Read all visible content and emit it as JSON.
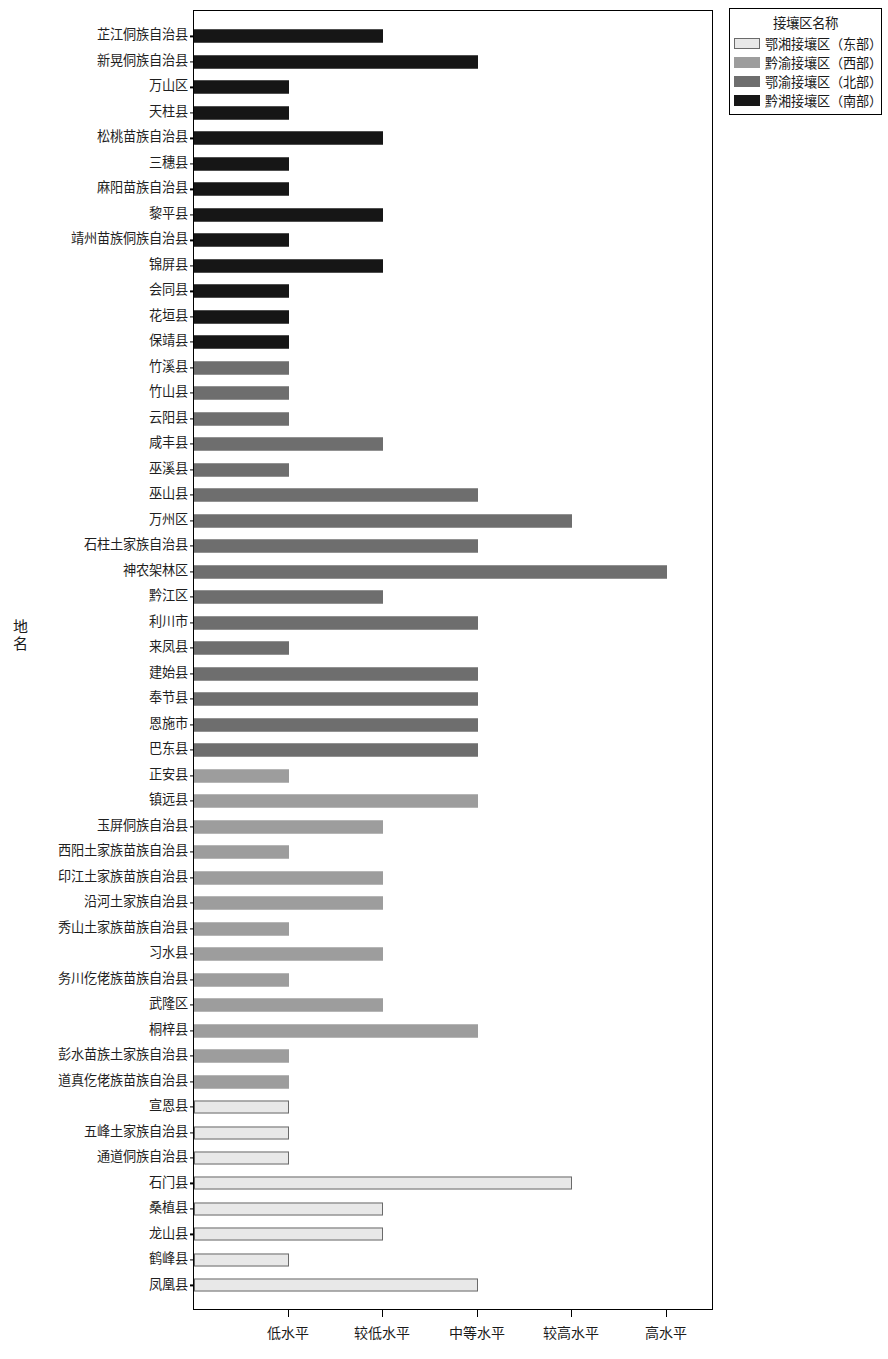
{
  "chart_data": {
    "type": "bar",
    "orientation": "horizontal",
    "title": "",
    "xlabel": "",
    "ylabel": "地名",
    "x_tick_labels": [
      "低水平",
      "较低水平",
      "中等水平",
      "较高水平",
      "高水平"
    ],
    "x_tick_values": [
      1,
      2,
      3,
      4,
      5
    ],
    "xlim": [
      0,
      5.5
    ],
    "grid": false,
    "legend": {
      "title": "接壤区名称",
      "position": "top-right",
      "entries": [
        {
          "label": "鄂湘接壤区（东部）",
          "color": "#e8e8e8"
        },
        {
          "label": "黔渝接壤区（西部）",
          "color": "#9d9d9d"
        },
        {
          "label": "鄂渝接壤区（北部）",
          "color": "#6e6e6e"
        },
        {
          "label": "黔湘接壤区（南部）",
          "color": "#161616"
        }
      ]
    },
    "categories": [
      "芷江侗族自治县",
      "新晃侗族自治县",
      "万山区",
      "天柱县",
      "松桃苗族自治县",
      "三穗县",
      "麻阳苗族自治县",
      "黎平县",
      "靖州苗族侗族自治县",
      "锦屏县",
      "会同县",
      "花垣县",
      "保靖县",
      "竹溪县",
      "竹山县",
      "云阳县",
      "咸丰县",
      "巫溪县",
      "巫山县",
      "万州区",
      "石柱土家族自治县",
      "神农架林区",
      "黔江区",
      "利川市",
      "来凤县",
      "建始县",
      "奉节县",
      "恩施市",
      "巴东县",
      "正安县",
      "镇远县",
      "玉屏侗族自治县",
      "西阳土家族苗族自治县",
      "印江土家族苗族自治县",
      "沿河土家族自治县",
      "秀山土家族苗族自治县",
      "习水县",
      "务川仡佬族苗族自治县",
      "武隆区",
      "桐梓县",
      "彭水苗族土家族自治县",
      "道真仡佬族苗族自治县",
      "宣恩县",
      "五峰土家族自治县",
      "通道侗族自治县",
      "石门县",
      "桑植县",
      "龙山县",
      "鹤峰县",
      "凤凰县"
    ],
    "values": [
      2,
      3,
      1,
      1,
      2,
      1,
      1,
      2,
      1,
      2,
      1,
      1,
      1,
      1,
      1,
      1,
      2,
      1,
      3,
      4,
      3,
      5,
      2,
      3,
      1,
      3,
      3,
      3,
      3,
      1,
      3,
      2,
      1,
      2,
      2,
      1,
      2,
      1,
      2,
      3,
      1,
      1,
      1,
      1,
      1,
      4,
      2,
      2,
      1,
      3
    ],
    "group_index": [
      3,
      3,
      3,
      3,
      3,
      3,
      3,
      3,
      3,
      3,
      3,
      3,
      3,
      2,
      2,
      2,
      2,
      2,
      2,
      2,
      2,
      2,
      2,
      2,
      2,
      2,
      2,
      2,
      2,
      1,
      1,
      1,
      1,
      1,
      1,
      1,
      1,
      1,
      1,
      1,
      1,
      1,
      0,
      0,
      0,
      0,
      0,
      0,
      0,
      0
    ],
    "series": [
      {
        "name": "鄂湘接壤区（东部）",
        "color": "#e8e8e8"
      },
      {
        "name": "黔渝接壤区（西部）",
        "color": "#9d9d9d"
      },
      {
        "name": "鄂渝接壤区（北部）",
        "color": "#6e6e6e"
      },
      {
        "name": "黔湘接壤区（南部）",
        "color": "#161616"
      }
    ]
  }
}
